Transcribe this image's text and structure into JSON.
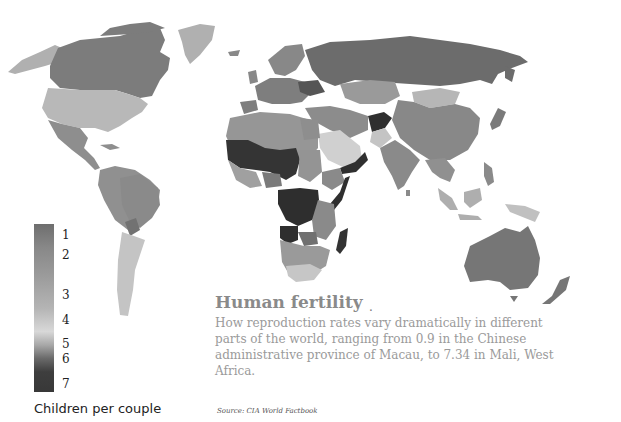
{
  "title": "Human fertility",
  "title_marker": ".",
  "description": "How reproduction rates vary dramatically in different parts of the world, ranging from 0.9 in the Chinese administrative province of Macau, to 7.34 in Mali, West Africa.",
  "source": "Source: CIA World Factbook",
  "legend": {
    "caption": "Children per couple",
    "ticks": [
      "1",
      "2",
      "3",
      "4",
      "5",
      "6",
      "7"
    ]
  },
  "colors": {
    "background": "#ffffff",
    "scale_1": "#6e6e6e",
    "scale_2": "#8a8a8a",
    "scale_3": "#a0a0a0",
    "scale_4": "#d6d6d6",
    "scale_5": "#8c8c8c",
    "scale_6": "#555555",
    "scale_7": "#333333"
  },
  "regions": [
    {
      "name": "Canada",
      "shade": "dark-mid"
    },
    {
      "name": "United States",
      "shade": "light"
    },
    {
      "name": "Greenland",
      "shade": "light"
    },
    {
      "name": "Alaska",
      "shade": "light"
    },
    {
      "name": "Mexico",
      "shade": "mid"
    },
    {
      "name": "South America",
      "shade": "mid"
    },
    {
      "name": "Argentina",
      "shade": "light"
    },
    {
      "name": "Russia",
      "shade": "dark-mid"
    },
    {
      "name": "Europe",
      "shade": "mid"
    },
    {
      "name": "Ukraine",
      "shade": "dark"
    },
    {
      "name": "China",
      "shade": "mid"
    },
    {
      "name": "Mongolia",
      "shade": "light"
    },
    {
      "name": "India",
      "shade": "mid"
    },
    {
      "name": "Afghanistan",
      "shade": "darkest"
    },
    {
      "name": "Saudi Arabia",
      "shade": "very-light"
    },
    {
      "name": "Yemen",
      "shade": "darkest"
    },
    {
      "name": "West Africa Sahel",
      "shade": "darkest"
    },
    {
      "name": "Central Africa",
      "shade": "darkest"
    },
    {
      "name": "Somalia",
      "shade": "darkest"
    },
    {
      "name": "Madagascar",
      "shade": "darkest"
    },
    {
      "name": "Southern Africa",
      "shade": "light"
    },
    {
      "name": "Australia",
      "shade": "dark-mid"
    },
    {
      "name": "Indonesia",
      "shade": "light"
    },
    {
      "name": "Papua New Guinea",
      "shade": "light"
    },
    {
      "name": "New Zealand",
      "shade": "dark-mid"
    }
  ]
}
